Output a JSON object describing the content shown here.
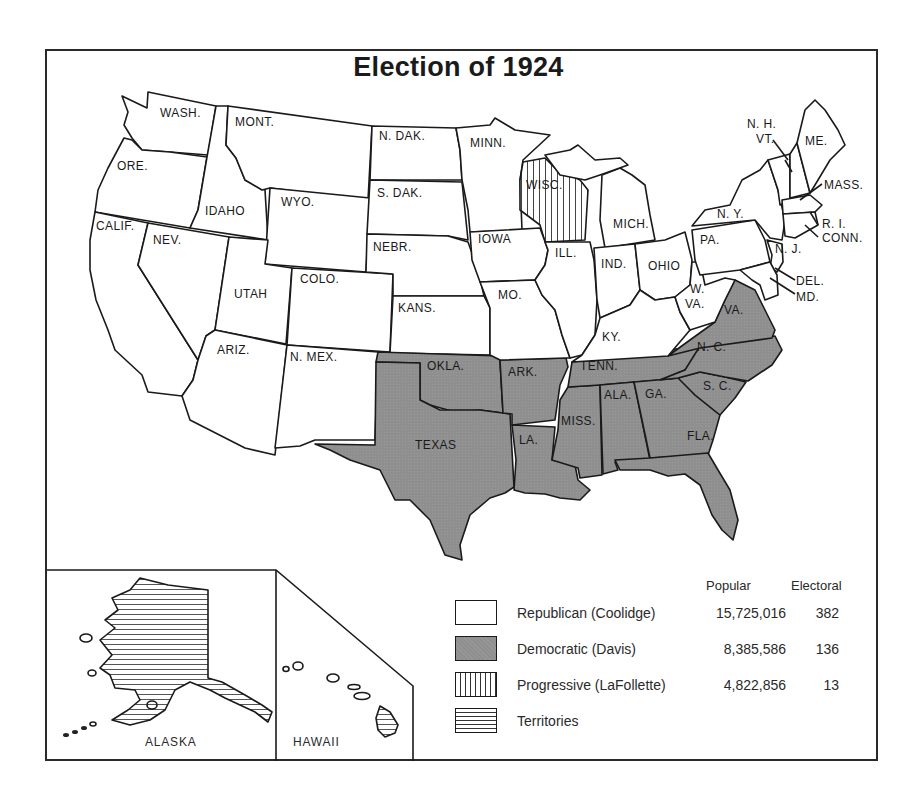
{
  "title": "Election of 1924",
  "colors": {
    "republican": "#ffffff",
    "democratic": "#8f8f8f",
    "border": "#1a1a1a"
  },
  "legend": {
    "col_popular": "Popular",
    "col_electoral": "Electoral",
    "entries": [
      {
        "label": "Republican (Coolidge)",
        "popular": "15,725,016",
        "electoral": "382",
        "pattern": "white"
      },
      {
        "label": "Democratic (Davis)",
        "popular": "8,385,586",
        "electoral": "136",
        "pattern": "gray"
      },
      {
        "label": "Progressive (LaFollette)",
        "popular": "4,822,856",
        "electoral": "13",
        "pattern": "vertical-lines"
      },
      {
        "label": "Territories",
        "popular": "",
        "electoral": "",
        "pattern": "horizontal-lines"
      }
    ]
  },
  "insets": {
    "alaska": "ALASKA",
    "hawaii": "HAWAII"
  },
  "states": {
    "wash": "WASH.",
    "ore": "ORE.",
    "calif": "CALIF.",
    "idaho": "IDAHO",
    "nev": "NEV.",
    "mont": "MONT.",
    "wyo": "WYO.",
    "utah": "UTAH",
    "ariz": "ARIZ.",
    "colo": "COLO.",
    "nmex": "N. MEX.",
    "ndak": "N. DAK.",
    "sdak": "S. DAK.",
    "nebr": "NEBR.",
    "kans": "KANS.",
    "okla": "OKLA.",
    "texas": "TEXAS",
    "minn": "MINN.",
    "iowa": "IOWA",
    "mo": "MO.",
    "ark": "ARK.",
    "la": "LA.",
    "wisc": "WISC.",
    "ill": "ILL.",
    "mich": "MICH.",
    "ind": "IND.",
    "ohio": "OHIO",
    "ky": "KY.",
    "tenn": "TENN.",
    "miss": "MISS.",
    "ala": "ALA.",
    "ga": "GA.",
    "fla": "FLA.",
    "sc": "S. C.",
    "nc": "N. C.",
    "va": "VA.",
    "wva1": "W.",
    "wva2": "VA.",
    "pa": "PA.",
    "ny": "N. Y.",
    "nj": "N. J.",
    "del": "DEL.",
    "md": "MD.",
    "conn": "CONN.",
    "ri": "R. I.",
    "mass": "MASS.",
    "vt": "VT.",
    "nh": "N. H.",
    "me": "ME."
  },
  "results": {
    "republican": [
      "WASH.",
      "ORE.",
      "CALIF.",
      "IDAHO",
      "NEV.",
      "MONT.",
      "WYO.",
      "UTAH",
      "ARIZ.",
      "COLO.",
      "N. MEX.",
      "N. DAK.",
      "S. DAK.",
      "NEBR.",
      "KANS.",
      "MINN.",
      "IOWA",
      "MO.",
      "ILL.",
      "MICH.",
      "IND.",
      "OHIO",
      "KY.",
      "W. VA.",
      "PA.",
      "N. Y.",
      "N. J.",
      "DEL.",
      "MD.",
      "CONN.",
      "R. I.",
      "MASS.",
      "VT.",
      "N. H.",
      "ME."
    ],
    "democratic": [
      "OKLA.",
      "TEXAS",
      "ARK.",
      "LA.",
      "TENN.",
      "MISS.",
      "ALA.",
      "GA.",
      "FLA.",
      "S. C.",
      "N. C.",
      "VA."
    ],
    "progressive": [
      "WISC."
    ],
    "territories": [
      "ALASKA",
      "HAWAII"
    ]
  }
}
